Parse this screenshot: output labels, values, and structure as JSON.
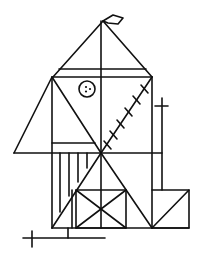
{
  "figure": {
    "stroke_color": "#111111",
    "background_color": "#ffffff",
    "elements": {
      "flag": "kite/diamond shape at apex",
      "roof": "triangle with two horizontal eaves lines",
      "button": "circle with three dots",
      "hatched_diagonal_ticks": 6,
      "vertical_hatch_lines": 4,
      "crosses": 2
    }
  }
}
